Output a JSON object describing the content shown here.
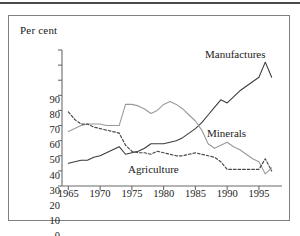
{
  "figure": {
    "y_axis_title": "Per cent"
  },
  "chart_data": {
    "type": "line",
    "title": "",
    "xlabel": "",
    "ylabel": "Per cent",
    "xlim": [
      1964,
      1998
    ],
    "ylim": [
      0,
      90
    ],
    "grid": false,
    "legend": "inline-annotations",
    "y_ticks": [
      0,
      10,
      20,
      30,
      40,
      50,
      60,
      70,
      80,
      90
    ],
    "x_ticks": [
      1965,
      1970,
      1975,
      1980,
      1985,
      1990,
      1995
    ],
    "x_tick_labels": [
      "1965",
      "1970",
      "1975",
      "1980",
      "1985",
      "1990",
      "1995"
    ],
    "x": [
      1965,
      1966,
      1967,
      1968,
      1969,
      1970,
      1971,
      1972,
      1973,
      1974,
      1975,
      1976,
      1977,
      1978,
      1979,
      1980,
      1981,
      1982,
      1983,
      1984,
      1985,
      1986,
      1987,
      1988,
      1989,
      1990,
      1991,
      1992,
      1993,
      1994,
      1995,
      1996,
      1997
    ],
    "series": [
      {
        "name": "Manufactures",
        "style": "solid",
        "color": "#3d3d3d",
        "values": [
          15,
          16,
          17,
          17,
          19,
          20,
          22,
          24,
          26,
          21,
          22,
          23,
          25,
          28,
          28,
          28,
          29,
          30,
          32,
          35,
          38,
          42,
          47,
          52,
          57,
          55,
          59,
          63,
          66,
          69,
          72,
          82,
          72
        ]
      },
      {
        "name": "Minerals",
        "style": "solid",
        "color": "#9a9a9a",
        "values": [
          36,
          38,
          40,
          41,
          41,
          41,
          40,
          40,
          40,
          54,
          54,
          53,
          51,
          48,
          50,
          54,
          56,
          54,
          51,
          47,
          43,
          37,
          28,
          25,
          27,
          29,
          26,
          24,
          21,
          18,
          16,
          8,
          12
        ]
      },
      {
        "name": "Agriculture",
        "style": "dotted",
        "color": "#4a4a4a",
        "values": [
          49,
          44,
          41,
          41,
          39,
          38,
          37,
          36,
          35,
          27,
          23,
          22,
          22,
          21,
          23,
          22,
          21,
          20,
          20,
          21,
          22,
          21,
          20,
          19,
          16,
          11,
          11,
          11,
          11,
          11,
          11,
          18,
          10
        ]
      }
    ],
    "annotations": [
      {
        "text": "Manufactures",
        "x": 1993,
        "y": 86
      },
      {
        "text": "Minerals",
        "x": 1993,
        "y": 33
      },
      {
        "text": "Agriculture",
        "x": 1979,
        "y": 9
      }
    ]
  }
}
